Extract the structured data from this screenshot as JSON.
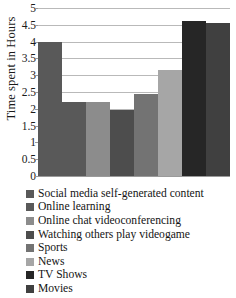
{
  "chart_data": {
    "type": "bar",
    "title": "",
    "xlabel": "",
    "ylabel": "Time spent in Hours",
    "ylim": [
      0,
      5
    ],
    "ytick_step": 0.5,
    "grid": true,
    "legend_position": "bottom-left",
    "categories": [
      "Social media self-generated content",
      "Online learning",
      "Online chat videoconferencing",
      "Watching others play videogame",
      "Sports",
      "News",
      "TV Shows",
      "Movies"
    ],
    "values": [
      4.0,
      2.2,
      2.2,
      1.95,
      2.45,
      3.15,
      4.6,
      4.55
    ],
    "colors": [
      "#595959",
      "#595959",
      "#8c8c8c",
      "#4d4d4d",
      "#737373",
      "#a6a6a6",
      "#262626",
      "#404040"
    ],
    "ytick_labels": [
      "5",
      "4.5",
      "4",
      "3.5",
      "3",
      "2.5",
      "2",
      "1.5",
      "1",
      "0.5",
      "0"
    ],
    "yticks": [
      5,
      4.5,
      4,
      3.5,
      3,
      2.5,
      2,
      1.5,
      1,
      0.5,
      0
    ]
  },
  "legend": {
    "items": [
      {
        "label": "Social media self-generated content",
        "color": "#595959"
      },
      {
        "label": "Online learning",
        "color": "#595959"
      },
      {
        "label": "Online chat videoconferencing",
        "color": "#8c8c8c"
      },
      {
        "label": "Watching others play videogame",
        "color": "#4d4d4d"
      },
      {
        "label": "Sports",
        "color": "#737373"
      },
      {
        "label": "News",
        "color": "#a6a6a6"
      },
      {
        "label": "TV Shows",
        "color": "#262626"
      },
      {
        "label": "Movies",
        "color": "#404040"
      }
    ]
  }
}
